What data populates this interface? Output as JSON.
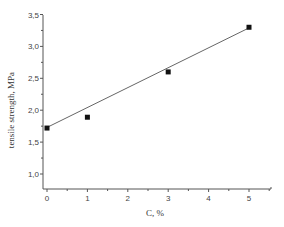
{
  "chart_data": {
    "type": "scatter",
    "title": "",
    "xlabel": "C, %",
    "ylabel": "tensile strength, MPa",
    "x_ticks": [
      "0",
      "1",
      "2",
      "3",
      "4",
      "5"
    ],
    "y_ticks": [
      "1,0",
      "1,5",
      "2,0",
      "2,5",
      "3,0",
      "3,5"
    ],
    "xlim": [
      -0.1,
      5.5
    ],
    "ylim": [
      0.77,
      3.5
    ],
    "grid": false,
    "legend": null,
    "series": [
      {
        "name": "measured",
        "marker": "square",
        "x": [
          0,
          1,
          3,
          5
        ],
        "y": [
          1.72,
          1.89,
          2.6,
          3.3
        ]
      },
      {
        "name": "linear fit",
        "style": "line",
        "x": [
          0,
          5
        ],
        "y": [
          1.73,
          3.29
        ]
      }
    ]
  }
}
